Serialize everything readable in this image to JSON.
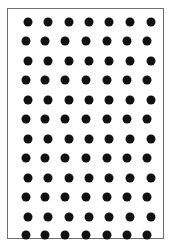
{
  "diagram": {
    "type": "dot-grid",
    "rows": 12,
    "columns": 7,
    "dot_color": "#111111",
    "border_color": "#6e6e6e",
    "background": "#ffffff",
    "row_y": [
      22,
      41,
      61,
      80,
      100,
      119,
      139,
      158,
      178,
      197,
      217,
      235
    ],
    "even_row_x": [
      28,
      48,
      69,
      89,
      109,
      130,
      151
    ],
    "odd_row_x": [
      26,
      45,
      65,
      86,
      107,
      127,
      147
    ]
  }
}
